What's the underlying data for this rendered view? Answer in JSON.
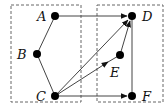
{
  "diagram": {
    "groups": [
      {
        "id": "left",
        "x": 11,
        "y": 5,
        "w": 70,
        "h": 97,
        "style": "dashed"
      },
      {
        "id": "right",
        "x": 97,
        "y": 5,
        "w": 66,
        "h": 97,
        "style": "dashed"
      }
    ],
    "nodes": [
      {
        "id": "A",
        "label": "A",
        "x": 55,
        "y": 16
      },
      {
        "id": "B",
        "label": "B",
        "x": 37,
        "y": 54
      },
      {
        "id": "C",
        "label": "C",
        "x": 55,
        "y": 96
      },
      {
        "id": "D",
        "label": "D",
        "x": 132,
        "y": 16
      },
      {
        "id": "E",
        "label": "E",
        "x": 120,
        "y": 55
      },
      {
        "id": "F",
        "label": "F",
        "x": 132,
        "y": 96
      }
    ],
    "edges": [
      {
        "from": "A",
        "to": "B",
        "directed": false
      },
      {
        "from": "B",
        "to": "C",
        "directed": false
      },
      {
        "from": "A",
        "to": "D",
        "directed": true
      },
      {
        "from": "C",
        "to": "D",
        "directed": true
      },
      {
        "from": "C",
        "to": "E",
        "directed": true
      },
      {
        "from": "E",
        "to": "D",
        "directed": true
      },
      {
        "from": "C",
        "to": "F",
        "directed": true
      },
      {
        "from": "D",
        "to": "F",
        "directed": false
      }
    ]
  }
}
